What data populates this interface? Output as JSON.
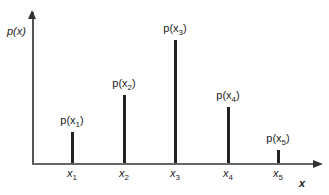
{
  "chart_data": {
    "type": "bar",
    "title": "",
    "xlabel": "x",
    "ylabel": "p(x)",
    "categories": [
      "x1",
      "x2",
      "x3",
      "x4",
      "x5"
    ],
    "values": [
      31,
      68,
      123,
      56,
      13
    ],
    "value_labels": [
      "p(x1)",
      "p(x2)",
      "p(x3)",
      "p(x4)",
      "p(x5)"
    ],
    "grid": false,
    "legend": "none",
    "style": "stem/line bars (discrete probability distribution)"
  },
  "axes": {
    "ylabel": "p(x)",
    "xlabel": "x"
  },
  "bars": [
    {
      "x": 72,
      "top": 132,
      "label_base": "p(x",
      "label_sub": "1",
      "tick_base": "x",
      "tick_sub": "1"
    },
    {
      "x": 124,
      "top": 95,
      "label_base": "p(x",
      "label_sub": "2",
      "tick_base": "x",
      "tick_sub": "2"
    },
    {
      "x": 175,
      "top": 40,
      "label_base": "p(x",
      "label_sub": "3",
      "tick_base": "x",
      "tick_sub": "3"
    },
    {
      "x": 228,
      "top": 107,
      "label_base": "p(x",
      "label_sub": "4",
      "tick_base": "x",
      "tick_sub": "4"
    },
    {
      "x": 278,
      "top": 150,
      "label_base": "p(x",
      "label_sub": "5",
      "tick_base": "x",
      "tick_sub": "5"
    }
  ],
  "close_paren": ")"
}
